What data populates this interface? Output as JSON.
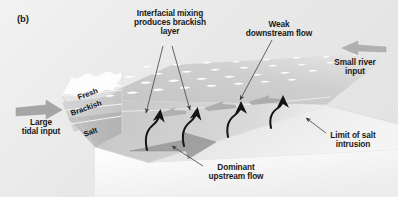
{
  "figure": {
    "panel_label": "(b)",
    "type": "estuary-cross-section-diagram"
  },
  "annotations": {
    "interfacial": "Interfacial mixing\nproduces brackish\nlayer",
    "weak_downstream": "Weak\ndownstream flow",
    "small_river": "Small river\ninput",
    "large_tidal": "Large\ntidal input",
    "dominant_upstream": "Dominant\nupstream flow",
    "limit_salt": "Limit of salt\nintrusion"
  },
  "layers": [
    {
      "label": "Fresh",
      "tone": "#e4e4e4"
    },
    {
      "label": "Brackish",
      "tone": "#cfcfcf"
    },
    {
      "label": "Salt",
      "tone": "#bcbcbc"
    }
  ],
  "colors": {
    "background": "#ebebeb",
    "water_surface": "#c9c9c9",
    "wave_crest": "#ffffff",
    "block_side": "#d6d6d6",
    "block_bottom": "#fafafa",
    "flow_arrow": "#9a9a9a",
    "mixing_arrow": "#1a1a1a",
    "leader_line": "#555555",
    "text": "#1a1a1a"
  },
  "flow_arrows": {
    "tidal_input": "right-pointing-gray-arrow",
    "river_input": "left-pointing-gray-arrow",
    "upstream_dominant": "right-pointing-large-gray-arrow",
    "downstream_weak": "left-pointing-small-gray-arrows",
    "mixing": "curved-black-upward-arrows"
  }
}
